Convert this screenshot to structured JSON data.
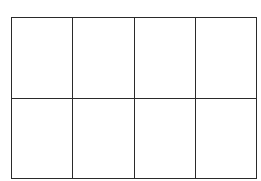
{
  "figure": {
    "kind": "empty-grid",
    "background_color": "#ffffff",
    "line_color": "#2a2a2a",
    "line_width_px": 1.4,
    "columns": 4,
    "rows": 2,
    "bounds": {
      "left_px": 11,
      "top_px": 17,
      "width_px": 246,
      "height_px": 159
    },
    "vertical_divider_x_px": [
      74,
      135,
      196
    ],
    "horizontal_divider_y_px": [
      97
    ],
    "caption": ""
  },
  "chart_data": {
    "type": "table",
    "title": "",
    "xlabel": "",
    "ylabel": "",
    "columns": [
      "",
      "",
      "",
      ""
    ],
    "rows": [
      [
        "",
        "",
        "",
        ""
      ],
      [
        "",
        "",
        "",
        ""
      ]
    ],
    "grid": true,
    "legend": null,
    "annotations": []
  },
  "cells": {
    "r0c0": "",
    "r0c1": "",
    "r0c2": "",
    "r0c3": "",
    "r1c0": "",
    "r1c1": "",
    "r1c2": "",
    "r1c3": ""
  }
}
